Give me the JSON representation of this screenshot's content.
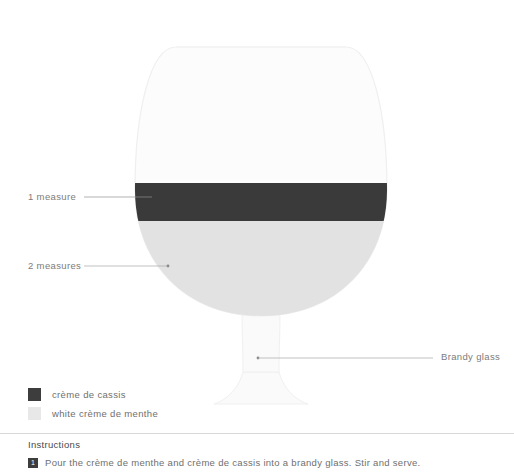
{
  "diagram": {
    "glass": {
      "name": "Brandy glass",
      "label": "Brandy glass"
    },
    "layers": [
      {
        "id": "creme-de-cassis",
        "name": "crème de cassis",
        "measure_label": "1 measure",
        "measures": 1,
        "color": "#3a3a3a"
      },
      {
        "id": "white-creme-de-menthe",
        "name": "white crème de menthe",
        "measure_label": "2 measures",
        "measures": 2,
        "color": "#e2e2e2"
      }
    ],
    "colors": {
      "glass_outline": "#ededed",
      "glass_fill": "#fcfcfc",
      "leader_line": "#9a9a9a",
      "divider": "#d8d8d8"
    }
  },
  "legend": {
    "items": [
      {
        "label": "crème de cassis",
        "color": "#3d3d3d"
      },
      {
        "label": "white crème de menthe",
        "color": "#e8e8e8"
      }
    ]
  },
  "instructions": {
    "heading": "Instructions",
    "steps": [
      {
        "number": "1",
        "text": "Pour the crème de menthe and crème de cassis into a brandy glass. Stir and serve."
      }
    ]
  }
}
